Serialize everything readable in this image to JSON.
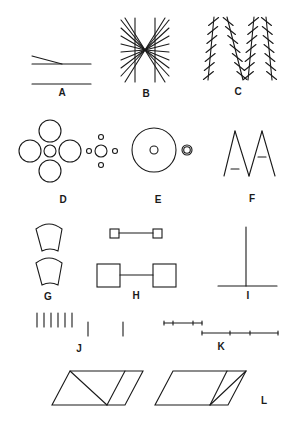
{
  "figure": {
    "background": "#ffffff",
    "ink": "#1a1a1a"
  },
  "panels": [
    {
      "id": "A",
      "label": "A",
      "label_pos": [
        62,
        96
      ],
      "name": "poggendorff-like-converging-lines",
      "lines": [
        [
          32,
          56,
          62,
          64
        ],
        [
          32,
          64,
          91,
          64
        ],
        [
          32,
          84,
          91,
          84
        ]
      ]
    },
    {
      "id": "B",
      "label": "B",
      "label_pos": [
        146,
        97
      ],
      "name": "hering-illusion",
      "parallels": [
        [
          135,
          18,
          135,
          82
        ],
        [
          155,
          18,
          155,
          82
        ]
      ],
      "center": [
        145,
        50
      ],
      "ray_ends": [
        [
          121,
          20
        ],
        [
          121,
          28
        ],
        [
          121,
          36
        ],
        [
          121,
          44
        ],
        [
          121,
          52
        ],
        [
          121,
          60
        ],
        [
          121,
          68
        ],
        [
          121,
          76
        ],
        [
          125,
          82
        ],
        [
          169,
          20
        ],
        [
          169,
          28
        ],
        [
          169,
          36
        ],
        [
          169,
          44
        ],
        [
          169,
          52
        ],
        [
          169,
          60
        ],
        [
          169,
          68
        ],
        [
          169,
          76
        ],
        [
          165,
          82
        ],
        [
          125,
          18
        ],
        [
          165,
          18
        ]
      ]
    },
    {
      "id": "C",
      "label": "C",
      "label_pos": [
        238,
        95
      ],
      "name": "zollner-illusion",
      "columns": [
        {
          "top": [
            214,
            17
          ],
          "bottom": [
            208,
            80
          ],
          "hatch": "right"
        },
        {
          "top": [
            227,
            17
          ],
          "bottom": [
            243,
            80
          ],
          "hatch": "left"
        },
        {
          "top": [
            254,
            17
          ],
          "bottom": [
            248,
            80
          ],
          "hatch": "right"
        },
        {
          "top": [
            266,
            17
          ],
          "bottom": [
            272,
            80
          ],
          "hatch": "left"
        }
      ],
      "hatch_count": 7
    },
    {
      "id": "D",
      "label": "D",
      "label_pos": [
        63,
        203
      ],
      "name": "ebbinghaus-illusion",
      "circles": [
        [
          50,
          131,
          11
        ],
        [
          50,
          171,
          11
        ],
        [
          30,
          151,
          11
        ],
        [
          70,
          151,
          11
        ],
        [
          50,
          151,
          6
        ],
        [
          101,
          151,
          6
        ],
        [
          101,
          137,
          2.5
        ],
        [
          101,
          165,
          2.5
        ],
        [
          89,
          151,
          2.5
        ],
        [
          115,
          151,
          2.5
        ]
      ]
    },
    {
      "id": "E",
      "label": "E",
      "label_pos": [
        158,
        203
      ],
      "name": "delboeuf-illusion",
      "circles": [
        [
          154,
          150,
          22
        ],
        [
          154,
          150,
          4
        ],
        [
          187,
          150,
          5
        ],
        [
          187,
          150,
          3.3
        ]
      ]
    },
    {
      "id": "F",
      "label": "F",
      "label_pos": [
        252,
        202
      ],
      "name": "ponzo-like-triangles",
      "lines": [
        [
          224,
          176,
          235,
          131
        ],
        [
          235,
          131,
          249,
          176
        ],
        [
          249,
          176,
          262,
          131
        ],
        [
          262,
          131,
          275,
          176
        ],
        [
          231,
          169,
          239,
          169
        ],
        [
          258,
          157,
          266,
          157
        ]
      ]
    },
    {
      "id": "G",
      "label": "G",
      "label_pos": [
        48,
        300
      ],
      "name": "jastrow-illusion",
      "shapes": [
        {
          "path": "M36,229 Q49,219 62,229 L58,251 Q50,247 42,251 Z"
        },
        {
          "path": "M36,263 Q49,253 62,263 L58,285 Q50,281 42,285 Z"
        }
      ]
    },
    {
      "id": "H",
      "label": "H",
      "label_pos": [
        136,
        299
      ],
      "name": "muller-lyer-squares",
      "rects": [
        [
          110,
          229,
          9,
          9
        ],
        [
          153,
          229,
          9,
          9
        ],
        [
          97,
          264,
          23,
          23
        ],
        [
          153,
          264,
          23,
          23
        ]
      ],
      "lines": [
        [
          119,
          233,
          153,
          233
        ],
        [
          120,
          275,
          153,
          275
        ]
      ]
    },
    {
      "id": "I",
      "label": "I",
      "label_pos": [
        248,
        299
      ],
      "name": "vertical-horizontal-illusion",
      "lines": [
        [
          246,
          227,
          246,
          286
        ],
        [
          218,
          286,
          277,
          286
        ]
      ]
    },
    {
      "id": "J",
      "label": "J",
      "label_pos": [
        79,
        352
      ],
      "name": "oppel-kundt-filled-space",
      "lines": [
        [
          37,
          313,
          37,
          327
        ],
        [
          44,
          313,
          44,
          327
        ],
        [
          51,
          313,
          51,
          327
        ],
        [
          58,
          313,
          58,
          327
        ],
        [
          65,
          313,
          65,
          327
        ],
        [
          72,
          313,
          72,
          327
        ],
        [
          88,
          322,
          88,
          336
        ],
        [
          123,
          322,
          123,
          336
        ]
      ]
    },
    {
      "id": "K",
      "label": "K",
      "label_pos": [
        221,
        350
      ],
      "name": "divided-line-illusion",
      "lines": [
        [
          164,
          323,
          202,
          323
        ],
        [
          202,
          333,
          278,
          333
        ]
      ],
      "ticks": [
        [
          164,
          323
        ],
        [
          173,
          323
        ],
        [
          193,
          323
        ],
        [
          202,
          323
        ],
        [
          202,
          333
        ],
        [
          230,
          333
        ],
        [
          250,
          333
        ],
        [
          278,
          333
        ]
      ]
    },
    {
      "id": "L",
      "label": "L",
      "label_pos": [
        264,
        404
      ],
      "name": "sander-parallelogram",
      "shapes": [
        {
          "path": "M70,371 L143,371 L125,405 L52,405 Z"
        },
        {
          "path": "M173,371 L246,371 L228,405 L155,405 Z"
        }
      ],
      "lines": [
        [
          70,
          371,
          107,
          405
        ],
        [
          125,
          371,
          107,
          405
        ],
        [
          227,
          371,
          210,
          405
        ],
        [
          246,
          371,
          210,
          405
        ]
      ]
    }
  ]
}
